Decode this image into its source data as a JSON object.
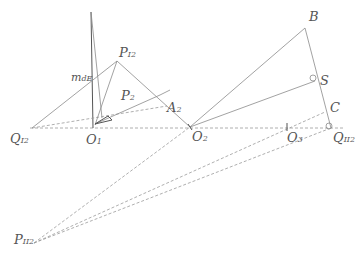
{
  "diagram": {
    "type": "geometric-construction",
    "labels": {
      "Q_I2": {
        "main": "Q",
        "sub": "I2"
      },
      "O_1": {
        "main": "O",
        "sub": "1"
      },
      "O_2": {
        "main": "O",
        "sub": "2"
      },
      "O_3": {
        "main": "O",
        "sub": "3"
      },
      "P_I2": {
        "main": "P",
        "sub": "I2"
      },
      "P_2": {
        "main": "P",
        "sub": "2"
      },
      "A_2": {
        "main": "A",
        "sub": "2"
      },
      "m_dE": {
        "main": "m",
        "sub": "dE"
      },
      "B": {
        "main": "B"
      },
      "S": {
        "main": "S"
      },
      "C": {
        "main": "C"
      },
      "Q_II2": {
        "main": "Q",
        "sub": "II2"
      },
      "P_II2": {
        "main": "P",
        "sub": "II2"
      }
    },
    "points": {
      "Q_I2": [
        32,
        128
      ],
      "O_1": [
        93,
        128
      ],
      "O_2": [
        190,
        127
      ],
      "O_3": [
        287,
        127
      ],
      "P_I2": [
        117,
        61
      ],
      "A_2": [
        167,
        106
      ],
      "top": [
        91,
        12
      ],
      "B": [
        305,
        28
      ],
      "S": [
        315,
        81
      ],
      "C": [
        325,
        112
      ],
      "Q_II2": [
        331,
        128
      ],
      "P_II2": [
        34,
        243
      ]
    }
  }
}
